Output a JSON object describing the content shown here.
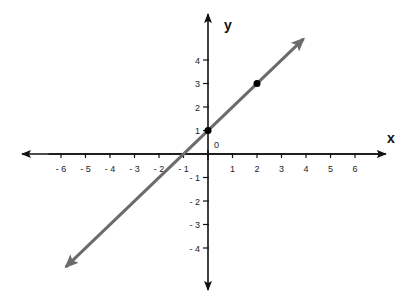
{
  "chart_data": {
    "type": "line",
    "title": "",
    "xlabel": "x",
    "ylabel": "y",
    "origin_label": "0",
    "xlim": [
      -7,
      7.5
    ],
    "ylim": [
      -5.8,
      5.9
    ],
    "x_ticks": [
      -6,
      -5,
      -4,
      -3,
      -2,
      -1,
      1,
      2,
      3,
      4,
      5,
      6
    ],
    "x_tick_labels": [
      "- 6",
      "- 5",
      "- 4",
      "- 3",
      "- 2",
      "- 1",
      "1",
      "2",
      "3",
      "4",
      "5",
      "6"
    ],
    "y_ticks": [
      -4,
      -3,
      -2,
      -1,
      1,
      2,
      3,
      4
    ],
    "y_tick_labels": [
      "- 4",
      "- 3",
      "- 2",
      "- 1",
      "1",
      "2",
      "3",
      "4"
    ],
    "grid": false,
    "series": [
      {
        "name": "y = x + 1",
        "type": "line",
        "slope": 1,
        "intercept": 1,
        "arrows_both_ends": true,
        "x_range": [
          -5.8,
          3.9
        ],
        "color": "#6b6b6b"
      }
    ],
    "points": [
      {
        "x": 0,
        "y": 1
      },
      {
        "x": 2,
        "y": 3
      }
    ],
    "colors": {
      "axis": "#111111",
      "line": "#6b6b6b",
      "point": "#000000"
    }
  }
}
